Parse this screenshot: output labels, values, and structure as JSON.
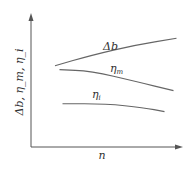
{
  "chart_data": {
    "type": "line",
    "title": "",
    "xlabel": "n",
    "ylabel": "Δb, η_m, η_i",
    "xlim": [
      0,
      1
    ],
    "ylim": [
      0,
      1
    ],
    "grid": false,
    "legend": "inline labels",
    "series": [
      {
        "name": "Δb",
        "label": "Δb",
        "x": [
          0.16,
          0.4,
          0.7,
          0.97
        ],
        "y": [
          0.62,
          0.7,
          0.78,
          0.83
        ]
      },
      {
        "name": "η_m",
        "label": "η",
        "sub": "m",
        "x": [
          0.19,
          0.4,
          0.7,
          0.95
        ],
        "y": [
          0.59,
          0.58,
          0.5,
          0.43
        ]
      },
      {
        "name": "η_i",
        "label": "η",
        "sub": "i",
        "x": [
          0.21,
          0.5,
          0.75,
          0.89
        ],
        "y": [
          0.33,
          0.33,
          0.3,
          0.27
        ]
      }
    ]
  }
}
